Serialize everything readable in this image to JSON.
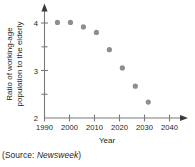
{
  "caption": {
    "prefix": "(Source: ",
    "publication": "Newsweek",
    "suffix": ")"
  },
  "chart_data": {
    "type": "scatter",
    "title": "",
    "xlabel": "Year",
    "ylabel": "Ratio of working-age population to the elderly",
    "ylabel_line1": "Ratio of working-age",
    "ylabel_line2": "population to the elderly",
    "x": [
      1995,
      2000,
      2005,
      2010,
      2015,
      2020,
      2025,
      2030
    ],
    "values": [
      4.1,
      4.1,
      4.0,
      3.88,
      3.5,
      3.1,
      2.7,
      2.35
    ],
    "xlim": [
      1990,
      2043
    ],
    "ylim": [
      2,
      4.35
    ],
    "xticks": [
      1990,
      2000,
      2010,
      2020,
      2030,
      2040
    ],
    "xtick_labels": [
      "1990",
      "2000",
      "2010",
      "2020",
      "2030",
      "2040"
    ],
    "yticks": [
      2,
      3,
      4
    ],
    "ytick_labels": [
      "2",
      "3",
      "4"
    ],
    "yminor_ticks": [
      2.5,
      3.5
    ],
    "grid": false,
    "legend": false,
    "marker_color": "#8e8e8e",
    "axis_color": "#7a7a7a",
    "marker_radius": 2.6
  }
}
